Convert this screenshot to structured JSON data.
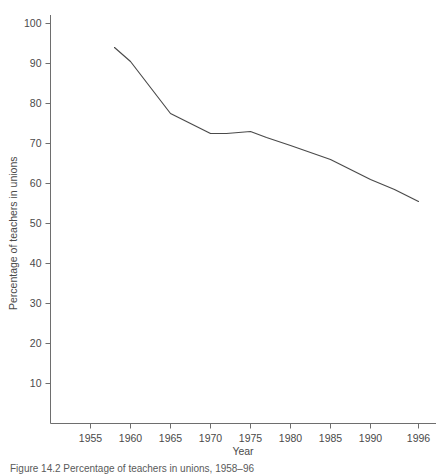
{
  "chart_data": {
    "type": "line",
    "title": "",
    "xlabel": "Year",
    "ylabel": "Percentage of teachers in unions",
    "xlim": [
      1953,
      1998
    ],
    "ylim": [
      0,
      104
    ],
    "xticks": [
      1955,
      1960,
      1965,
      1970,
      1975,
      1980,
      1985,
      1990,
      1996
    ],
    "xticklabels": [
      "1955",
      "1960",
      "1965",
      "1970",
      "1975",
      "1980",
      "1985",
      "1990",
      "1996"
    ],
    "yticks": [
      10,
      20,
      30,
      40,
      50,
      60,
      70,
      80,
      90,
      100
    ],
    "yticklabels": [
      "10",
      "20",
      "30",
      "40",
      "50",
      "60",
      "70",
      "80",
      "90",
      "100"
    ],
    "grid": false,
    "legend": false,
    "line_color": "#4a4a4a",
    "axis_color": "#6e6e6e",
    "series": [
      {
        "name": "Percentage of teachers in unions",
        "x": [
          1958,
          1960,
          1965,
          1970,
          1972,
          1975,
          1977,
          1980,
          1985,
          1987,
          1990,
          1993,
          1996
        ],
        "values": [
          94.0,
          90.5,
          77.5,
          72.5,
          72.5,
          73.0,
          71.5,
          69.5,
          66.0,
          64.0,
          61.0,
          58.5,
          55.5
        ]
      }
    ]
  },
  "caption": {
    "text": "Figure 14.2  Percentage of teachers in unions, 1958–96"
  }
}
